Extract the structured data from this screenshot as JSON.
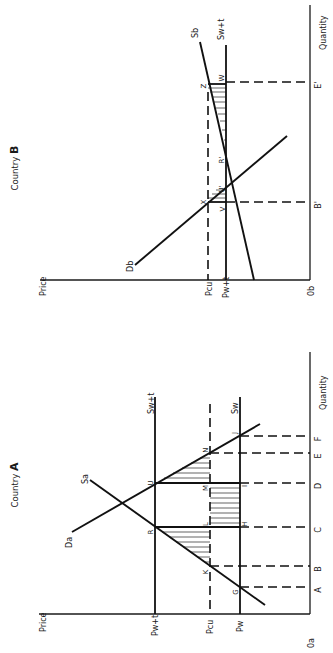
{
  "figure": {
    "background": "#ffffff",
    "ink": "#111111",
    "orientation": "rotated 90 degrees counter-clockwise"
  },
  "country_a": {
    "title_prefix": "Country",
    "title_letter": "A",
    "axes": {
      "y_label": "Price",
      "x_label": "Quantity",
      "origin": "0a"
    },
    "price_levels": [
      {
        "id": "pwt",
        "label": "Pw+t",
        "style": "solid",
        "line_label": "Sw+t"
      },
      {
        "id": "pcu",
        "label": "Pcu",
        "style": "dashed"
      },
      {
        "id": "pw",
        "label": "Pw",
        "style": "solid",
        "line_label": "Sw"
      }
    ],
    "curves": {
      "demand": "Da",
      "supply": "Sa"
    },
    "quantity_ticks": [
      "A",
      "B",
      "C",
      "D",
      "E",
      "F"
    ],
    "points": [
      "G",
      "K",
      "R",
      "L",
      "H",
      "U",
      "M",
      "I",
      "N",
      "J"
    ]
  },
  "country_b": {
    "title_prefix": "Country",
    "title_letter": "B",
    "axes": {
      "y_label": "Price",
      "x_label": "Quantity",
      "origin": "0b"
    },
    "price_levels": [
      {
        "id": "pcu",
        "label": "Pcu",
        "style": "dashed"
      },
      {
        "id": "pwt",
        "label": "Pw+t",
        "style": "solid",
        "line_label": "Sw+t"
      }
    ],
    "curves": {
      "demand": "Db",
      "supply": "Sb"
    },
    "quantity_ticks": [
      "B'",
      "E'"
    ],
    "points": [
      "X",
      "V",
      "U'",
      "R'",
      "Z",
      "W"
    ]
  }
}
